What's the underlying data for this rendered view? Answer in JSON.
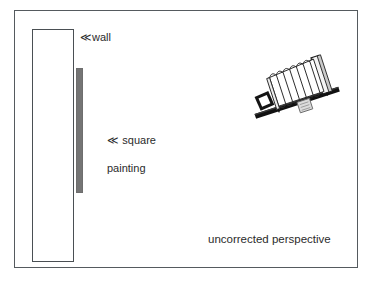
{
  "figure": {
    "caption": "uncorrected perspective"
  },
  "labels": {
    "wall": {
      "arrow": "≪",
      "text": "wall",
      "full": "≪wall"
    },
    "painting": {
      "arrow": "≪",
      "line1": "≪ square",
      "line2": "painting",
      "full": "≪ square painting"
    },
    "perspective": {
      "text": "uncorrected perspective"
    }
  },
  "shapes": {
    "outer_frame": {
      "name": "diagram-border",
      "x": 14,
      "y": 10,
      "width": 344,
      "height": 258
    },
    "wall": {
      "name": "wall-rectangle",
      "x": 32,
      "y": 29,
      "width": 42,
      "height": 233
    },
    "painting": {
      "name": "square-painting-edge-on",
      "x": 76,
      "y": 68,
      "width": 7,
      "height": 125
    },
    "camera": {
      "name": "view-camera",
      "x": 243,
      "y": 54,
      "width": 100,
      "height": 72,
      "tilt_degrees": -18
    }
  },
  "camera_parts": {
    "rail": "monorail",
    "bellows": "accordion-bellows",
    "front_standard": "lens-board",
    "rear_standard": "ground-glass-back",
    "lens": "lens-square",
    "knob": "focus-knob",
    "bellows_folds": 9
  },
  "colors": {
    "border": "#555a5e",
    "wall_outline": "#4a4f53",
    "painting_fill": "#757575",
    "text": "#2b2b2b",
    "camera_dark": "#111111",
    "camera_light": "#f2f2f2",
    "background": "#ffffff"
  }
}
